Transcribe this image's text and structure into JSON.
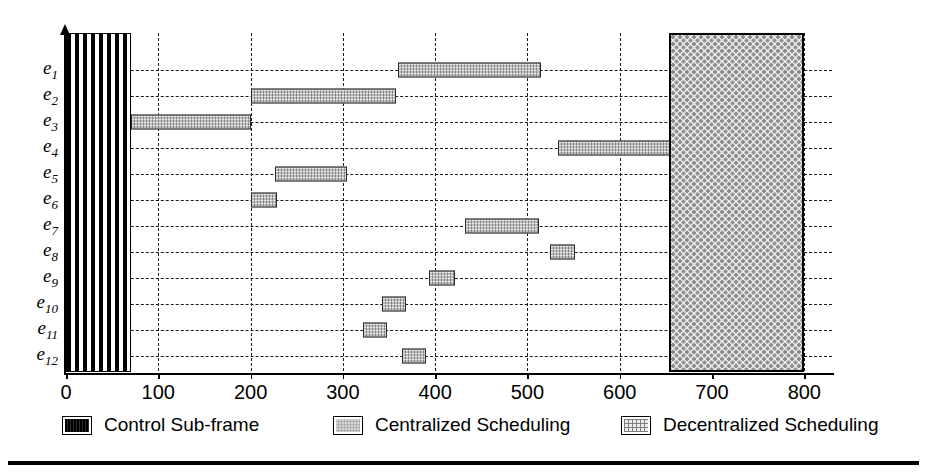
{
  "figure": {
    "row_labels": [
      "e1",
      "e2",
      "e3",
      "e4",
      "e5",
      "e6",
      "e7",
      "e8",
      "e9",
      "e10",
      "e11",
      "e12"
    ],
    "row_label_base": "e",
    "row_label_subs": [
      "1",
      "2",
      "3",
      "4",
      "5",
      "6",
      "7",
      "8",
      "9",
      "10",
      "11",
      "12"
    ]
  },
  "legend": {
    "position": "bottom",
    "items": [
      {
        "label": "Control Sub-frame",
        "pattern": "vertical-stripes",
        "color": "#111111",
        "swatch_icon": "control-subframe-swatch"
      },
      {
        "label": "Centralized Scheduling",
        "pattern": "light-stipple",
        "color": "#b0b0b0",
        "swatch_icon": "centralized-scheduling-swatch"
      },
      {
        "label": "Decentralized Scheduling",
        "pattern": "cross-hatch-dots",
        "color": "#e8e8e8",
        "swatch_icon": "decentralized-scheduling-swatch"
      }
    ]
  },
  "chart_data": {
    "type": "bar",
    "orientation": "horizontal",
    "subtype": "gantt",
    "title": "",
    "xlabel": "",
    "ylabel": "",
    "xlim": [
      0,
      830
    ],
    "xticks": [
      0,
      100,
      200,
      300,
      400,
      500,
      600,
      700,
      800
    ],
    "xticklabels": [
      "0",
      "100",
      "200",
      "300",
      "400",
      "500",
      "600",
      "700",
      "800"
    ],
    "categories": [
      "e1",
      "e2",
      "e3",
      "e4",
      "e5",
      "e6",
      "e7",
      "e8",
      "e9",
      "e10",
      "e11",
      "e12"
    ],
    "grid": {
      "vertical": true,
      "horizontal": true,
      "style": "dashed"
    },
    "series": [
      {
        "name": "Control Sub-frame",
        "pattern": "vertical-stripes",
        "color": "#111111",
        "spans": [
          {
            "start": 0,
            "end": 70,
            "rows": "all"
          }
        ]
      },
      {
        "name": "Centralized Scheduling",
        "pattern": "light-stipple",
        "color": "#b0b0b0",
        "spans": [
          {
            "category": "e1",
            "start": 360,
            "end": 515
          },
          {
            "category": "e2",
            "start": 200,
            "end": 358
          },
          {
            "category": "e3",
            "start": 70,
            "end": 200
          },
          {
            "category": "e4",
            "start": 533,
            "end": 655
          },
          {
            "category": "e5",
            "start": 227,
            "end": 305
          },
          {
            "category": "e6",
            "start": 200,
            "end": 229
          },
          {
            "category": "e7",
            "start": 432,
            "end": 513
          },
          {
            "category": "e8",
            "start": 524,
            "end": 552
          },
          {
            "category": "e9",
            "start": 393,
            "end": 421
          },
          {
            "category": "e10",
            "start": 342,
            "end": 368
          },
          {
            "category": "e11",
            "start": 322,
            "end": 348
          },
          {
            "category": "e12",
            "start": 364,
            "end": 390
          }
        ]
      },
      {
        "name": "Decentralized Scheduling",
        "pattern": "cross-hatch-dots",
        "color": "#e8e8e8",
        "spans": [
          {
            "start": 653,
            "end": 800,
            "rows": "all"
          }
        ]
      }
    ]
  }
}
